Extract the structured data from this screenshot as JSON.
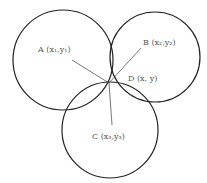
{
  "diagram": {
    "type": "trilateration",
    "circles": [
      {
        "id": "A",
        "cx": 63,
        "cy": 60,
        "r": 50
      },
      {
        "id": "B",
        "cx": 155,
        "cy": 57,
        "r": 45
      },
      {
        "id": "C",
        "cx": 110,
        "cy": 130,
        "r": 48
      }
    ],
    "point": {
      "x": 109,
      "y": 83
    },
    "labels": {
      "A": "A (x₁,y₁)",
      "B": "B (x₂,y₂)",
      "C": "C (x₃,y₃)",
      "D": "D (x, y)"
    },
    "colors": {
      "circle": "#222222",
      "line": "#555555",
      "text": "#555555"
    }
  }
}
